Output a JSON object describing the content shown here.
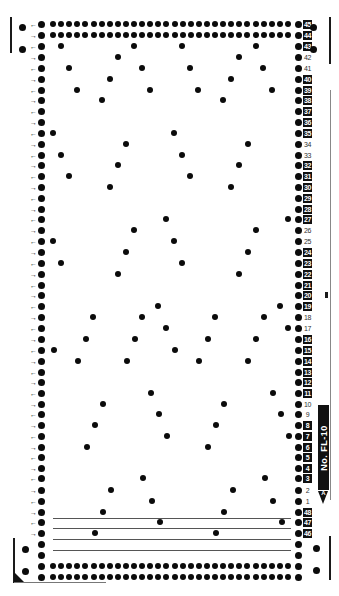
{
  "card": {
    "label": "No. FL-10",
    "marker": "A",
    "accent": "#111111",
    "background": "#ffffff"
  },
  "rows": [
    {
      "num": "45",
      "style": "inv",
      "y": 24,
      "full": true,
      "arrow": "←",
      "dots": []
    },
    {
      "num": "44",
      "style": "inv",
      "y": 35,
      "full": true,
      "arrow": "→",
      "dots": []
    },
    {
      "num": "43",
      "style": "inv",
      "y": 46,
      "full": false,
      "arrow": "←",
      "dots": [
        61,
        134,
        182,
        256
      ]
    },
    {
      "num": "42",
      "style": "plain",
      "y": 57,
      "full": false,
      "arrow": "→",
      "dots": [
        118,
        239
      ]
    },
    {
      "num": "41",
      "style": "plain",
      "y": 68,
      "full": false,
      "arrow": "←",
      "dots": [
        69,
        142,
        190,
        263
      ]
    },
    {
      "num": "40",
      "style": "inv",
      "y": 79,
      "full": false,
      "arrow": "→",
      "dots": [
        110,
        231
      ]
    },
    {
      "num": "39",
      "style": "inv",
      "y": 90,
      "full": false,
      "arrow": "←",
      "dots": [
        77,
        150,
        198,
        272
      ]
    },
    {
      "num": "38",
      "style": "inv",
      "y": 100,
      "full": false,
      "arrow": "→",
      "dots": [
        102,
        223
      ]
    },
    {
      "num": "37",
      "style": "inv",
      "y": 111,
      "full": false,
      "arrow": "←",
      "dots": []
    },
    {
      "num": "36",
      "style": "inv",
      "y": 122,
      "full": false,
      "arrow": "→",
      "dots": []
    },
    {
      "num": "35",
      "style": "inv",
      "y": 133,
      "full": false,
      "arrow": "←",
      "dots": [
        53,
        174
      ]
    },
    {
      "num": "34",
      "style": "plain",
      "y": 144,
      "full": false,
      "arrow": "→",
      "dots": [
        126,
        248
      ]
    },
    {
      "num": "33",
      "style": "plain",
      "y": 155,
      "full": false,
      "arrow": "←",
      "dots": [
        61,
        182
      ]
    },
    {
      "num": "32",
      "style": "inv",
      "y": 165,
      "full": false,
      "arrow": "→",
      "dots": [
        118,
        239
      ]
    },
    {
      "num": "31",
      "style": "inv",
      "y": 176,
      "full": false,
      "arrow": "←",
      "dots": [
        69,
        190
      ]
    },
    {
      "num": "30",
      "style": "inv",
      "y": 187,
      "full": false,
      "arrow": "→",
      "dots": [
        110,
        231
      ]
    },
    {
      "num": "29",
      "style": "inv",
      "y": 198,
      "full": false,
      "arrow": "←",
      "dots": []
    },
    {
      "num": "28",
      "style": "inv",
      "y": 209,
      "full": false,
      "arrow": "→",
      "dots": []
    },
    {
      "num": "27",
      "style": "inv",
      "y": 219,
      "full": false,
      "arrow": "←",
      "dots": [
        166,
        288
      ]
    },
    {
      "num": "26",
      "style": "plain",
      "y": 230,
      "full": false,
      "arrow": "→",
      "dots": [
        134,
        256
      ]
    },
    {
      "num": "25",
      "style": "plain",
      "y": 241,
      "full": false,
      "arrow": "←",
      "dots": [
        53,
        174
      ]
    },
    {
      "num": "24",
      "style": "inv",
      "y": 252,
      "full": false,
      "arrow": "→",
      "dots": [
        126,
        248
      ]
    },
    {
      "num": "23",
      "style": "inv",
      "y": 263,
      "full": false,
      "arrow": "←",
      "dots": [
        61,
        182
      ]
    },
    {
      "num": "22",
      "style": "inv",
      "y": 274,
      "full": false,
      "arrow": "→",
      "dots": [
        118,
        239
      ]
    },
    {
      "num": "21",
      "style": "inv",
      "y": 285,
      "full": false,
      "arrow": "←",
      "dots": []
    },
    {
      "num": "20",
      "style": "inv",
      "y": 295,
      "full": false,
      "arrow": "→",
      "dots": []
    },
    {
      "num": "19",
      "style": "inv",
      "y": 306,
      "full": false,
      "arrow": "←",
      "dots": [
        158,
        280
      ]
    },
    {
      "num": "18",
      "style": "plain",
      "y": 317,
      "full": false,
      "arrow": "→",
      "dots": [
        93,
        142,
        215,
        264
      ]
    },
    {
      "num": "17",
      "style": "plain",
      "y": 328,
      "full": false,
      "arrow": "←",
      "dots": [
        166,
        288
      ]
    },
    {
      "num": "16",
      "style": "inv",
      "y": 339,
      "full": false,
      "arrow": "→",
      "dots": [
        86,
        135,
        208,
        256
      ]
    },
    {
      "num": "15",
      "style": "inv",
      "y": 350,
      "full": false,
      "arrow": "←",
      "dots": [
        54,
        175
      ]
    },
    {
      "num": "14",
      "style": "inv",
      "y": 361,
      "full": false,
      "arrow": "→",
      "dots": [
        78,
        127,
        199,
        248
      ]
    },
    {
      "num": "13",
      "style": "inv",
      "y": 372,
      "full": false,
      "arrow": "←",
      "dots": []
    },
    {
      "num": "12",
      "style": "inv",
      "y": 382,
      "full": false,
      "arrow": "→",
      "dots": []
    },
    {
      "num": "11",
      "style": "inv",
      "y": 393,
      "full": false,
      "arrow": "←",
      "dots": [
        151,
        273
      ]
    },
    {
      "num": "10",
      "style": "plain",
      "y": 404,
      "full": false,
      "arrow": "→",
      "dots": [
        103,
        224
      ]
    },
    {
      "num": "9",
      "style": "plain",
      "y": 414,
      "full": false,
      "arrow": "←",
      "dots": [
        159,
        281
      ]
    },
    {
      "num": "8",
      "style": "inv",
      "y": 425,
      "full": false,
      "arrow": "→",
      "dots": [
        95,
        216
      ]
    },
    {
      "num": "7",
      "style": "inv",
      "y": 436,
      "full": false,
      "arrow": "←",
      "dots": [
        167,
        289
      ]
    },
    {
      "num": "6",
      "style": "inv",
      "y": 447,
      "full": false,
      "arrow": "→",
      "dots": [
        87,
        208
      ]
    },
    {
      "num": "5",
      "style": "inv",
      "y": 457,
      "full": false,
      "arrow": "←",
      "dots": []
    },
    {
      "num": "4",
      "style": "inv",
      "y": 468,
      "full": false,
      "arrow": "→",
      "dots": []
    },
    {
      "num": "3",
      "style": "inv",
      "y": 478,
      "full": false,
      "arrow": "←",
      "dots": [
        143,
        265
      ]
    },
    {
      "num": "2",
      "style": "plain",
      "y": 490,
      "full": false,
      "arrow": "→",
      "dots": [
        111,
        233
      ]
    },
    {
      "num": "1",
      "style": "plain",
      "y": 501,
      "full": false,
      "arrow": "←",
      "dots": [
        152,
        273
      ]
    },
    {
      "num": "48",
      "style": "inv",
      "y": 512,
      "full": false,
      "arrow": "→",
      "dots": [
        103,
        224
      ]
    },
    {
      "num": "47",
      "style": "inv",
      "y": 522,
      "full": false,
      "arrow": "←",
      "dots": [
        160,
        282
      ]
    },
    {
      "num": "46",
      "style": "inv",
      "y": 533,
      "full": false,
      "arrow": "→",
      "dots": [
        95,
        216
      ]
    },
    {
      "num": "",
      "style": "none",
      "y": 544,
      "full": false,
      "arrow": "",
      "dots": []
    },
    {
      "num": "",
      "style": "none",
      "y": 555,
      "full": false,
      "arrow": "",
      "dots": []
    },
    {
      "num": "",
      "style": "none",
      "y": 566,
      "full": true,
      "arrow": "",
      "dots": []
    },
    {
      "num": "",
      "style": "none",
      "y": 577,
      "full": true,
      "arrow": "",
      "dots": []
    }
  ],
  "guide_lines_y": [
    518,
    528,
    539,
    550
  ],
  "side_holes": [
    {
      "x": 22,
      "y": 27
    },
    {
      "x": 22,
      "y": 49
    },
    {
      "x": 313,
      "y": 27
    },
    {
      "x": 313,
      "y": 49
    },
    {
      "x": 25,
      "y": 549
    },
    {
      "x": 25,
      "y": 571
    },
    {
      "x": 316,
      "y": 548
    },
    {
      "x": 316,
      "y": 570
    }
  ]
}
